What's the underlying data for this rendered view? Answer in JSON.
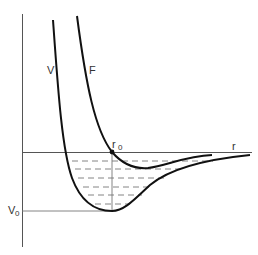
{
  "diagram": {
    "type": "potential-energy-curves",
    "labels": {
      "V_curve": "V",
      "F_curve": "F",
      "x_axis": "r",
      "equilibrium": {
        "main": "r",
        "sub": "0"
      },
      "well_depth": {
        "main": "V",
        "sub": "0"
      }
    },
    "curves": [
      {
        "name": "V",
        "description": "deep potential well with minimum V0 at r0"
      },
      {
        "name": "F",
        "description": "repulsive curve crossing axis at r0 with shallow minimum"
      }
    ],
    "energy_levels_count": 6,
    "colors": {
      "curve": "#111111",
      "axis": "#555555",
      "dash": "#777777"
    }
  }
}
